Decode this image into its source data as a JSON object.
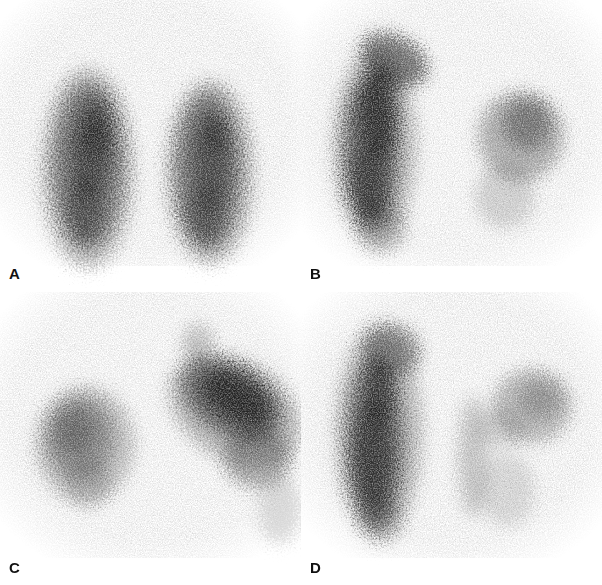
{
  "figure": {
    "kind": "four-panel grayscale scintigraphy scan figure",
    "panels": [
      {
        "label": "A"
      },
      {
        "label": "B"
      },
      {
        "label": "C"
      },
      {
        "label": "D"
      }
    ]
  },
  "colors": {
    "background": "#ffffff",
    "scan_ink": "#000000",
    "label_text": "#111111"
  }
}
